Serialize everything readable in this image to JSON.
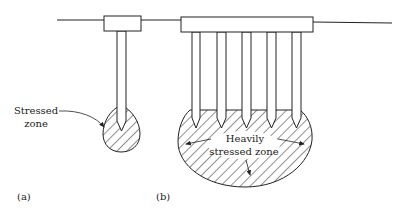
{
  "figure": {
    "panel_a": {
      "label": "(a)",
      "annotation_line1": "Stressed",
      "annotation_line2": "zone"
    },
    "panel_b": {
      "label": "(b)",
      "annotation_line1": "Heavily",
      "annotation_line2": "stressed zone"
    },
    "colors": {
      "stroke": "#222222",
      "background": "#ffffff"
    }
  }
}
